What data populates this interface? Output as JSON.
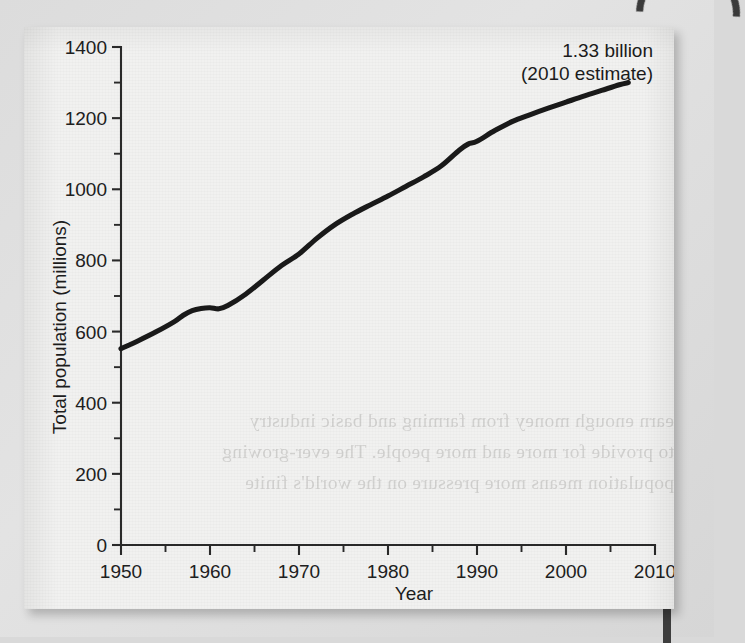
{
  "figure": {
    "annotation_line1": "1.33 billion",
    "annotation_line2": "(2010 estimate)",
    "bleed_text": [
      "earn enough money from farming and basic industry",
      "to provide for more and more people. The ever-growing",
      "population means more pressure on the world's finite"
    ]
  },
  "chart_data": {
    "type": "line",
    "title": "",
    "xlabel": "Year",
    "ylabel": "Total population (millions)",
    "xlim": [
      1950,
      2010
    ],
    "ylim": [
      0,
      1400
    ],
    "grid": false,
    "legend": null,
    "x_ticks_major": [
      1950,
      1960,
      1970,
      1980,
      1990,
      2000,
      2010
    ],
    "x_ticks_minor": [
      1955,
      1965,
      1975,
      1985,
      1995,
      2005
    ],
    "y_ticks_major": [
      0,
      200,
      400,
      600,
      800,
      1000,
      1200,
      1400
    ],
    "y_ticks_minor": [
      100,
      300,
      500,
      700,
      900,
      1100,
      1300
    ],
    "annotations": [
      {
        "text": "1.33 billion (2010 estimate)",
        "x": 2007,
        "y": 1330
      }
    ],
    "series": [
      {
        "name": "Total population",
        "x": [
          1950,
          1952,
          1954,
          1956,
          1957,
          1958,
          1959,
          1960,
          1961,
          1962,
          1964,
          1966,
          1968,
          1970,
          1972,
          1974,
          1976,
          1978,
          1980,
          1982,
          1984,
          1986,
          1988,
          1989,
          1990,
          1992,
          1994,
          1996,
          1998,
          2000,
          2002,
          2004,
          2006,
          2007
        ],
        "y": [
          552,
          575,
          600,
          628,
          646,
          659,
          665,
          667,
          664,
          673,
          705,
          745,
          785,
          818,
          862,
          900,
          930,
          956,
          981,
          1008,
          1035,
          1066,
          1110,
          1127,
          1135,
          1165,
          1191,
          1210,
          1228,
          1245,
          1262,
          1278,
          1294,
          1300
        ]
      }
    ]
  }
}
